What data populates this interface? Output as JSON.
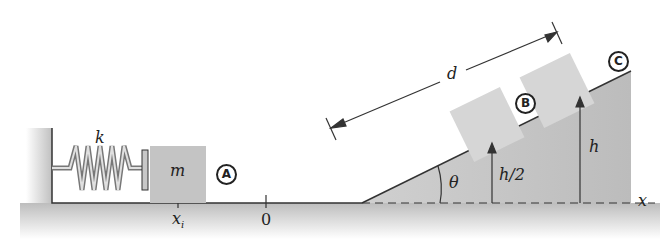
{
  "figure": {
    "labels": {
      "spring_constant": "k",
      "mass": "m",
      "initial_position": "x",
      "initial_position_sub": "i",
      "origin": "0",
      "distance": "d",
      "angle": "θ",
      "half_height": "h/2",
      "height": "h",
      "x_axis": "x"
    },
    "points": [
      {
        "id": "A",
        "label": "A"
      },
      {
        "id": "B",
        "label": "B"
      },
      {
        "id": "C",
        "label": "C"
      }
    ],
    "colors": {
      "ground": "#c8c8c8",
      "block": "#c4c4c4",
      "block_faded": "#d6d6d6",
      "line": "#333333",
      "spring": "#888888"
    }
  }
}
